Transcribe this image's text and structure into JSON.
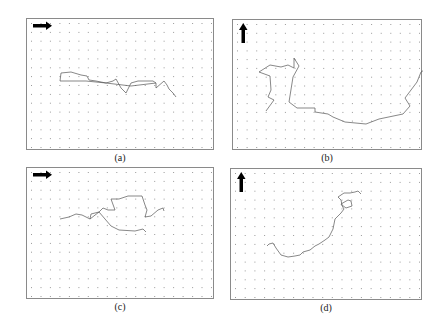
{
  "figure": {
    "panels": [
      {
        "id": "a",
        "caption": "(a)",
        "arrow_direction": "right",
        "box": {
          "left": 26,
          "top": 18,
          "width": 188,
          "height": 132
        },
        "trajectory": [
          [
            33,
            62
          ],
          [
            34,
            54
          ],
          [
            44,
            53
          ],
          [
            54,
            56
          ],
          [
            60,
            57
          ],
          [
            62,
            61
          ],
          [
            69,
            62
          ],
          [
            79,
            64
          ],
          [
            86,
            62
          ],
          [
            89,
            60
          ],
          [
            94,
            69
          ],
          [
            99,
            74
          ],
          [
            104,
            64
          ],
          [
            111,
            62
          ],
          [
            119,
            62
          ],
          [
            126,
            62
          ],
          [
            129,
            64
          ],
          [
            129,
            69
          ],
          [
            137,
            62
          ],
          [
            140,
            66
          ],
          [
            142,
            70
          ],
          [
            146,
            74
          ],
          [
            149,
            78
          ]
        ],
        "trajectory_return": [
          [
            33,
            62
          ],
          [
            59,
            62
          ],
          [
            79,
            64
          ],
          [
            104,
            67
          ],
          [
            129,
            64
          ]
        ]
      },
      {
        "id": "b",
        "caption": "(b)",
        "arrow_direction": "up",
        "box": {
          "left": 232,
          "top": 19,
          "width": 190,
          "height": 131
        },
        "trajectory": [
          [
            33,
            91
          ],
          [
            41,
            80
          ],
          [
            35,
            77
          ],
          [
            38,
            70
          ],
          [
            37,
            56
          ],
          [
            26,
            52
          ],
          [
            37,
            45
          ],
          [
            48,
            47
          ],
          [
            55,
            45
          ],
          [
            61,
            48
          ],
          [
            61,
            38
          ],
          [
            66,
            46
          ],
          [
            60,
            57
          ],
          [
            56,
            82
          ],
          [
            64,
            88
          ],
          [
            82,
            88
          ],
          [
            82,
            92
          ],
          [
            95,
            94
          ],
          [
            100,
            97
          ],
          [
            112,
            102
          ],
          [
            133,
            104
          ],
          [
            146,
            99
          ],
          [
            170,
            94
          ],
          [
            177,
            86
          ],
          [
            172,
            78
          ],
          [
            184,
            62
          ],
          [
            188,
            52
          ],
          [
            198,
            46
          ],
          [
            197,
            40
          ],
          [
            201,
            33
          ],
          [
            196,
            31
          ],
          [
            203,
            25
          ]
        ]
      },
      {
        "id": "c",
        "caption": "(c)",
        "arrow_direction": "right",
        "box": {
          "left": 26,
          "top": 167,
          "width": 188,
          "height": 132
        },
        "trajectory": [
          [
            33,
            51
          ],
          [
            42,
            49
          ],
          [
            49,
            46
          ],
          [
            55,
            47
          ],
          [
            63,
            51
          ],
          [
            64,
            46
          ],
          [
            72,
            44
          ],
          [
            76,
            40
          ],
          [
            81,
            42
          ],
          [
            88,
            42
          ],
          [
            84,
            31
          ],
          [
            92,
            31
          ],
          [
            101,
            28
          ],
          [
            115,
            28
          ],
          [
            118,
            37
          ],
          [
            120,
            42
          ],
          [
            118,
            49
          ],
          [
            124,
            48
          ],
          [
            131,
            42
          ],
          [
            136,
            40
          ],
          [
            137,
            43
          ]
        ],
        "trajectory_return": [
          [
            63,
            51
          ],
          [
            72,
            44
          ],
          [
            84,
            58
          ],
          [
            92,
            62
          ],
          [
            108,
            63
          ],
          [
            116,
            61
          ],
          [
            119,
            64
          ]
        ]
      },
      {
        "id": "d",
        "caption": "(d)",
        "arrow_direction": "up",
        "box": {
          "left": 230,
          "top": 168,
          "width": 192,
          "height": 132
        },
        "trajectory": [
          [
            36,
            77
          ],
          [
            38,
            75
          ],
          [
            42,
            74
          ],
          [
            45,
            79
          ],
          [
            50,
            86
          ],
          [
            57,
            88
          ],
          [
            64,
            87
          ],
          [
            69,
            86
          ],
          [
            72,
            83
          ],
          [
            79,
            81
          ],
          [
            84,
            77
          ],
          [
            88,
            75
          ],
          [
            94,
            71
          ],
          [
            98,
            68
          ],
          [
            102,
            60
          ],
          [
            104,
            50
          ],
          [
            110,
            44
          ],
          [
            113,
            40
          ],
          [
            110,
            35
          ],
          [
            117,
            31
          ],
          [
            120,
            32
          ],
          [
            121,
            37
          ],
          [
            115,
            39
          ],
          [
            111,
            36
          ],
          [
            110,
            31
          ],
          [
            107,
            28
          ],
          [
            113,
            24
          ],
          [
            119,
            24
          ],
          [
            124,
            23
          ],
          [
            127,
            22
          ],
          [
            130,
            25
          ]
        ]
      }
    ]
  }
}
